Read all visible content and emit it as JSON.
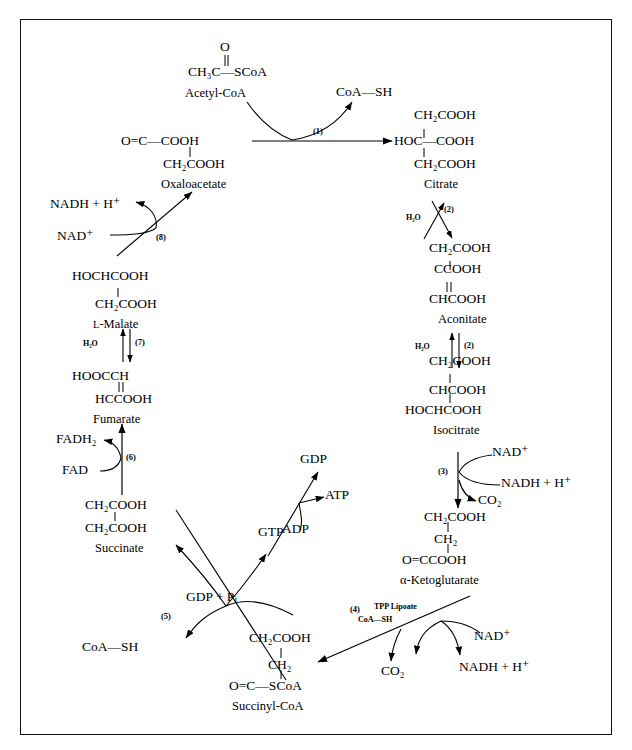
{
  "figure": {
    "frame_color": "#111111",
    "background": "#ffffff"
  },
  "metabolites": {
    "acetyl_coa": {
      "oxygen": "O",
      "formula": "CH₃C—SCoA",
      "name": "Acetyl-CoA"
    },
    "coash_top": {
      "label": "CoA—SH"
    },
    "oxaloacetate": {
      "line1": "O=C—COOH",
      "line2": "CH₂COOH",
      "name": "Oxaloacetate"
    },
    "citrate": {
      "line1": "CH₂COOH",
      "line2": "HOC—COOH",
      "line3": "CH₂COOH",
      "name": "Citrate"
    },
    "aconitate": {
      "line1": "CH₂COOH",
      "line2": "CCOOH",
      "line3": "CHCOOH",
      "name": "Aconitate"
    },
    "isocitrate": {
      "line1": "CH₂COOH",
      "line2": "CHCOOH",
      "line3": "HOCHCOOH",
      "name": "Isocitrate"
    },
    "alpha_ketoglutarate": {
      "line1": "CH₂COOH",
      "line2": "CH₂",
      "line3": "O=CCOOH",
      "name": "α-Ketoglutarate"
    },
    "succinyl_coa": {
      "line1": "CH₂COOH",
      "line2": "CH₂",
      "line3": "O=C—SCoA",
      "name": "Succinyl-CoA"
    },
    "succinate": {
      "line1": "CH₂COOH",
      "line2": "CH₂COOH",
      "name": "Succinate"
    },
    "fumarate": {
      "line1": "HOOCCH",
      "line2": "HCCOOH",
      "name": "Fumarate"
    },
    "l_malate": {
      "prefix": "L",
      "line1": "HOCHCOOH",
      "line2": "CH₂COOH",
      "name": "-Malate"
    }
  },
  "steps": {
    "s1": "(1)",
    "s2a": "(2)",
    "s2b": "(2)",
    "s3": "(3)",
    "s4": "(4)",
    "s5": "(5)",
    "s6": "(6)",
    "s7": "(7)",
    "s8": "(8)"
  },
  "cofactors": {
    "water_2a": "H₂O",
    "water_2b": "H₂O",
    "water_7": "H₂O",
    "nad_3": "NAD⁺",
    "nadh_3": "NADH + H⁺",
    "co2_3": "CO₂",
    "nad_4": "NAD⁺",
    "nadh_4": "NADH + H⁺",
    "co2_4": "CO₂",
    "tpp_lipoate": "TPP Lipoate",
    "coash_4": "CoA—SH",
    "gdp_pi": "GDP + P",
    "gdp_pi_sub": "i",
    "coash_5": "CoA—SH",
    "gtp": "GTP",
    "gdp": "GDP",
    "atp": "ATP",
    "adp": "ADP",
    "fad": "FAD",
    "fadh2": "FADH₂",
    "nad_8": "NAD⁺",
    "nadh_8": "NADH + H⁺"
  }
}
